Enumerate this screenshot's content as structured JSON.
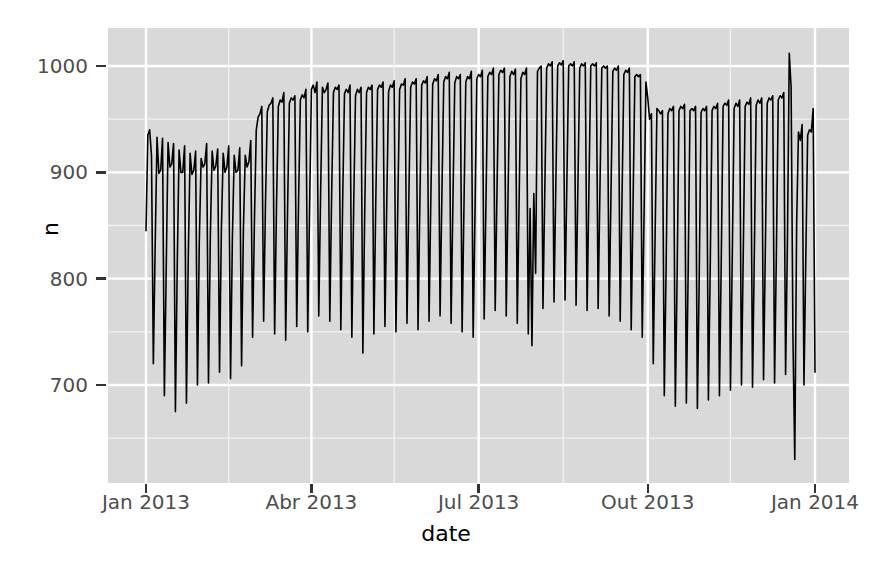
{
  "chart_data": {
    "type": "line",
    "title": "",
    "subtitle": "",
    "xlabel": "date",
    "ylabel": "n",
    "x_tick_labels": [
      "Jan 2013",
      "Abr 2013",
      "Jul 2013",
      "Out 2013",
      "Jan 2014"
    ],
    "x_tick_values": [
      "2013-01-01",
      "2013-04-01",
      "2013-07-01",
      "2013-10-01",
      "2014-01-01"
    ],
    "y_tick_labels": [
      "700",
      "800",
      "900",
      "1000"
    ],
    "y_tick_values": [
      700,
      800,
      900,
      1000
    ],
    "ylim": [
      620,
      1025
    ],
    "xlim": [
      "2013-01-01",
      "2013-12-31"
    ],
    "grid": true,
    "grid_major_color": "#ffffff",
    "grid_minor_color": "#f2f2f2",
    "panel_background": "#d9d9d9",
    "line_color": "#000000",
    "line_width": 1.6,
    "legend": "none",
    "series": [
      {
        "name": "n",
        "x_start_day": 1,
        "x_end_day": 365,
        "values": [
          845,
          935,
          940,
          915,
          720,
          832,
          933,
          899,
          902,
          932,
          690,
          810,
          928,
          905,
          908,
          927,
          675,
          812,
          921,
          900,
          900,
          925,
          683,
          820,
          918,
          898,
          902,
          920,
          700,
          835,
          913,
          905,
          908,
          927,
          702,
          840,
          920,
          902,
          906,
          922,
          712,
          845,
          918,
          900,
          905,
          925,
          706,
          838,
          916,
          900,
          902,
          923,
          718,
          847,
          916,
          905,
          910,
          930,
          745,
          855,
          940,
          952,
          955,
          962,
          760,
          870,
          957,
          963,
          965,
          970,
          748,
          868,
          962,
          968,
          966,
          975,
          742,
          862,
          965,
          970,
          968,
          972,
          755,
          872,
          968,
          973,
          970,
          978,
          750,
          865,
          978,
          982,
          975,
          985,
          765,
          880,
          980,
          975,
          978,
          984,
          760,
          878,
          975,
          980,
          978,
          982,
          752,
          872,
          974,
          978,
          975,
          982,
          745,
          868,
          972,
          978,
          975,
          980,
          730,
          862,
          975,
          980,
          978,
          982,
          748,
          870,
          978,
          982,
          980,
          985,
          755,
          872,
          976,
          982,
          980,
          986,
          750,
          868,
          978,
          983,
          982,
          988,
          758,
          875,
          980,
          985,
          983,
          988,
          752,
          870,
          982,
          986,
          984,
          990,
          760,
          878,
          983,
          988,
          986,
          992,
          765,
          880,
          985,
          990,
          988,
          994,
          758,
          872,
          984,
          990,
          988,
          992,
          750,
          868,
          985,
          990,
          988,
          995,
          745,
          862,
          988,
          992,
          990,
          996,
          762,
          875,
          990,
          994,
          992,
          998,
          770,
          885,
          992,
          996,
          994,
          998,
          765,
          880,
          990,
          995,
          992,
          997,
          758,
          872,
          988,
          994,
          992,
          998,
          748,
          866,
          737,
          880,
          805,
          995,
          998,
          1000,
          772,
          885,
          998,
          1002,
          1000,
          1004,
          778,
          890,
          1000,
          1003,
          1001,
          1005,
          780,
          892,
          1000,
          1002,
          1000,
          1004,
          775,
          888,
          998,
          1002,
          1000,
          1003,
          770,
          885,
          1000,
          1002,
          1000,
          1003,
          772,
          886,
          998,
          1000,
          998,
          1000,
          765,
          880,
          995,
          998,
          996,
          1000,
          760,
          876,
          992,
          996,
          994,
          998,
          752,
          870,
          990,
          992,
          990,
          992,
          745,
          860,
          985,
          970,
          950,
          955,
          720,
          840,
          960,
          958,
          955,
          958,
          690,
          812,
          955,
          960,
          958,
          962,
          680,
          805,
          958,
          962,
          960,
          964,
          683,
          808,
          958,
          960,
          958,
          962,
          678,
          800,
          956,
          960,
          958,
          962,
          686,
          812,
          958,
          962,
          960,
          965,
          690,
          818,
          962,
          965,
          963,
          968,
          695,
          822,
          960,
          965,
          962,
          968,
          700,
          828,
          962,
          966,
          964,
          970,
          698,
          825,
          963,
          968,
          965,
          970,
          705,
          830,
          965,
          970,
          968,
          972,
          702,
          826,
          968,
          972,
          970,
          975,
          710,
          835,
          1012,
          980,
          745,
          630,
          850,
          938,
          930,
          945,
          700,
          820,
          935,
          940,
          938,
          960,
          712,
          838,
          955,
          960,
          958,
          968,
          718,
          842,
          950,
          955,
          952,
          960,
          700,
          820,
          948,
          952,
          950,
          955,
          690,
          810,
          775,
          930,
          965,
          975,
          805,
          822,
          948,
          952,
          950,
          955,
          698,
          812,
          932,
          968
        ]
      }
    ]
  },
  "axis": {
    "y_title": "n",
    "x_title": "date"
  }
}
